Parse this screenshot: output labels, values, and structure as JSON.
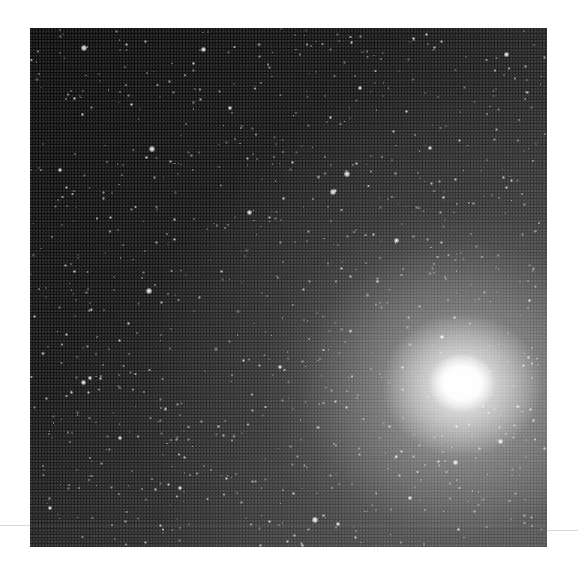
{
  "image": {
    "subject": "star field with bright elliptical galaxy core",
    "alt": "Astronomical photograph: dense star field on black background with a bright glowing galaxy nucleus at lower right",
    "core_position": {
      "x": 432,
      "y": 355
    },
    "colors": {
      "background": "#ffffff",
      "sky_dark": "#0a0a0a",
      "sky_mid": "#2a2a2a",
      "glow": "#b9b9b9",
      "core": "#ffffff",
      "guide_line": "#d8d8d8"
    },
    "bright_stars": [
      {
        "x": 54,
        "y": 20,
        "r": 3
      },
      {
        "x": 122,
        "y": 121,
        "r": 3
      },
      {
        "x": 173,
        "y": 21,
        "r": 2.5
      },
      {
        "x": 317,
        "y": 146,
        "r": 3
      },
      {
        "x": 303,
        "y": 164,
        "r": 3
      },
      {
        "x": 119,
        "y": 263,
        "r": 3
      },
      {
        "x": 219,
        "y": 184,
        "r": 2.5
      },
      {
        "x": 30,
        "y": 142,
        "r": 2
      },
      {
        "x": 53,
        "y": 354,
        "r": 2.5
      },
      {
        "x": 60,
        "y": 350,
        "r": 2
      },
      {
        "x": 285,
        "y": 492,
        "r": 3
      },
      {
        "x": 308,
        "y": 496,
        "r": 2
      },
      {
        "x": 476,
        "y": 26,
        "r": 2.5
      },
      {
        "x": 366,
        "y": 212,
        "r": 2.5
      },
      {
        "x": 412,
        "y": 309,
        "r": 2
      },
      {
        "x": 425,
        "y": 434,
        "r": 2.5
      },
      {
        "x": 470,
        "y": 413,
        "r": 2.5
      },
      {
        "x": 250,
        "y": 339,
        "r": 2
      },
      {
        "x": 90,
        "y": 410,
        "r": 2
      },
      {
        "x": 150,
        "y": 460,
        "r": 2
      },
      {
        "x": 200,
        "y": 80,
        "r": 2
      },
      {
        "x": 400,
        "y": 120,
        "r": 2
      },
      {
        "x": 330,
        "y": 60,
        "r": 2
      },
      {
        "x": 20,
        "y": 480,
        "r": 2
      },
      {
        "x": 380,
        "y": 470,
        "r": 2
      }
    ]
  }
}
